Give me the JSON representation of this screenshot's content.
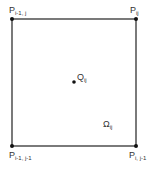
{
  "diagram": {
    "type": "grid-cell",
    "cell": {
      "label_main": "Ω",
      "label_sub": "ij"
    },
    "center": {
      "label_main": "Q",
      "label_sub": "ij"
    },
    "corners": [
      {
        "id": "top-left",
        "main": "P",
        "sub": "i-1, j"
      },
      {
        "id": "top-right",
        "main": "P",
        "sub": "ij"
      },
      {
        "id": "bottom-left",
        "main": "P",
        "sub": "i-1, j-1"
      },
      {
        "id": "bottom-right",
        "main": "P",
        "sub": "i, j-1"
      }
    ],
    "line_color": "#222222"
  }
}
